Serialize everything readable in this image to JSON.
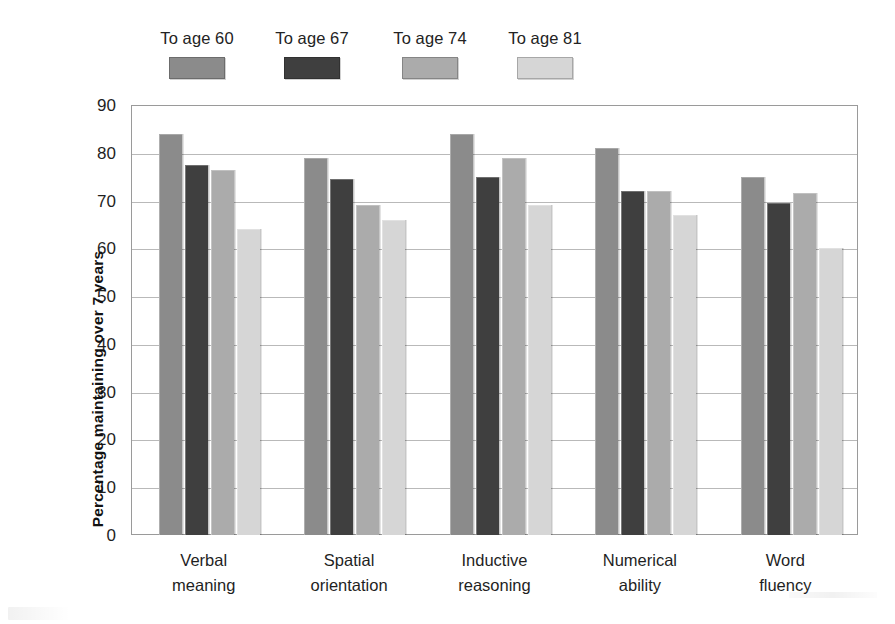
{
  "chart_data": {
    "type": "bar",
    "title": "",
    "subtitle": "",
    "xlabel": "",
    "ylabel": "Percentage maintaining over 7 years",
    "ylim": [
      0,
      90
    ],
    "ytick_step": 10,
    "yticks": [
      "90",
      "80",
      "70",
      "60",
      "50",
      "40",
      "30",
      "20",
      "10",
      "0"
    ],
    "grid": true,
    "grid_axis": "y",
    "legend_position": "top-left",
    "categories": [
      "Verbal\nmeaning",
      "Spatial\norientation",
      "Inductive\nreasoning",
      "Numerical\nability",
      "Word\nfluency"
    ],
    "category_lines": [
      [
        "Verbal",
        "meaning"
      ],
      [
        "Spatial",
        "orientation"
      ],
      [
        "Inductive",
        "reasoning"
      ],
      [
        "Numerical",
        "ability"
      ],
      [
        "Word",
        "fluency"
      ]
    ],
    "series": [
      {
        "name": "To age 60",
        "color": "#8b8b8b",
        "values": [
          84,
          79,
          84,
          81,
          75
        ]
      },
      {
        "name": "To age 67",
        "color": "#3f3f3f",
        "values": [
          77.5,
          74.5,
          75,
          72,
          69.5
        ]
      },
      {
        "name": "To age 74",
        "color": "#ababab",
        "values": [
          76.5,
          69,
          79,
          72,
          71.5
        ]
      },
      {
        "name": "To age 81",
        "color": "#d6d6d6",
        "values": [
          64,
          66,
          69,
          67,
          60
        ]
      }
    ]
  },
  "legend": {
    "items": [
      {
        "label": "To age 60",
        "color": "#8b8b8b",
        "swatch_name": "legend-swatch-to-age-60"
      },
      {
        "label": "To age 67",
        "color": "#3f3f3f",
        "swatch_name": "legend-swatch-to-age-67"
      },
      {
        "label": "To age 74",
        "color": "#ababab",
        "swatch_name": "legend-swatch-to-age-74"
      },
      {
        "label": "To age 81",
        "color": "#d6d6d6",
        "swatch_name": "legend-swatch-to-age-81"
      }
    ]
  },
  "axes": {
    "y_title": "Percentage maintaining over 7 years",
    "y_tick_labels": [
      "90",
      "80",
      "70",
      "60",
      "50",
      "40",
      "30",
      "20",
      "10",
      "0"
    ]
  }
}
